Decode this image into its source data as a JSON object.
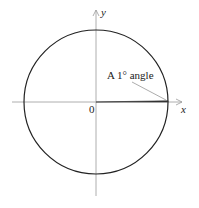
{
  "diagram": {
    "type": "unit-circle-angle",
    "axes": {
      "x_label": "x",
      "y_label": "y",
      "origin_label": "0"
    },
    "annotation": {
      "text": "A 1° angle"
    },
    "colors": {
      "circle": "#222222",
      "axis": "#999999",
      "wedge": "#333333",
      "leader": "#888888"
    }
  }
}
